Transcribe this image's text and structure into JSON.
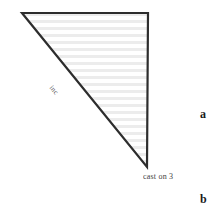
{
  "figure": {
    "type": "knitting-schematic",
    "background_color": "#ffffff",
    "outline_color": "#2d2d2d",
    "stripe_color": "#ececec",
    "fill_color": "#ffffff",
    "shape": {
      "name": "right-triangle",
      "vertices": [
        {
          "label": "top-left",
          "x": 22,
          "y": 13
        },
        {
          "label": "top-right",
          "x": 148,
          "y": 13
        },
        {
          "label": "bottom-right",
          "x": 147,
          "y": 167
        }
      ]
    },
    "labels": {
      "hypotenuse": "inc",
      "bottom_vertex": "cast on 3"
    },
    "panel_letters": {
      "a": "a",
      "b": "b"
    }
  }
}
